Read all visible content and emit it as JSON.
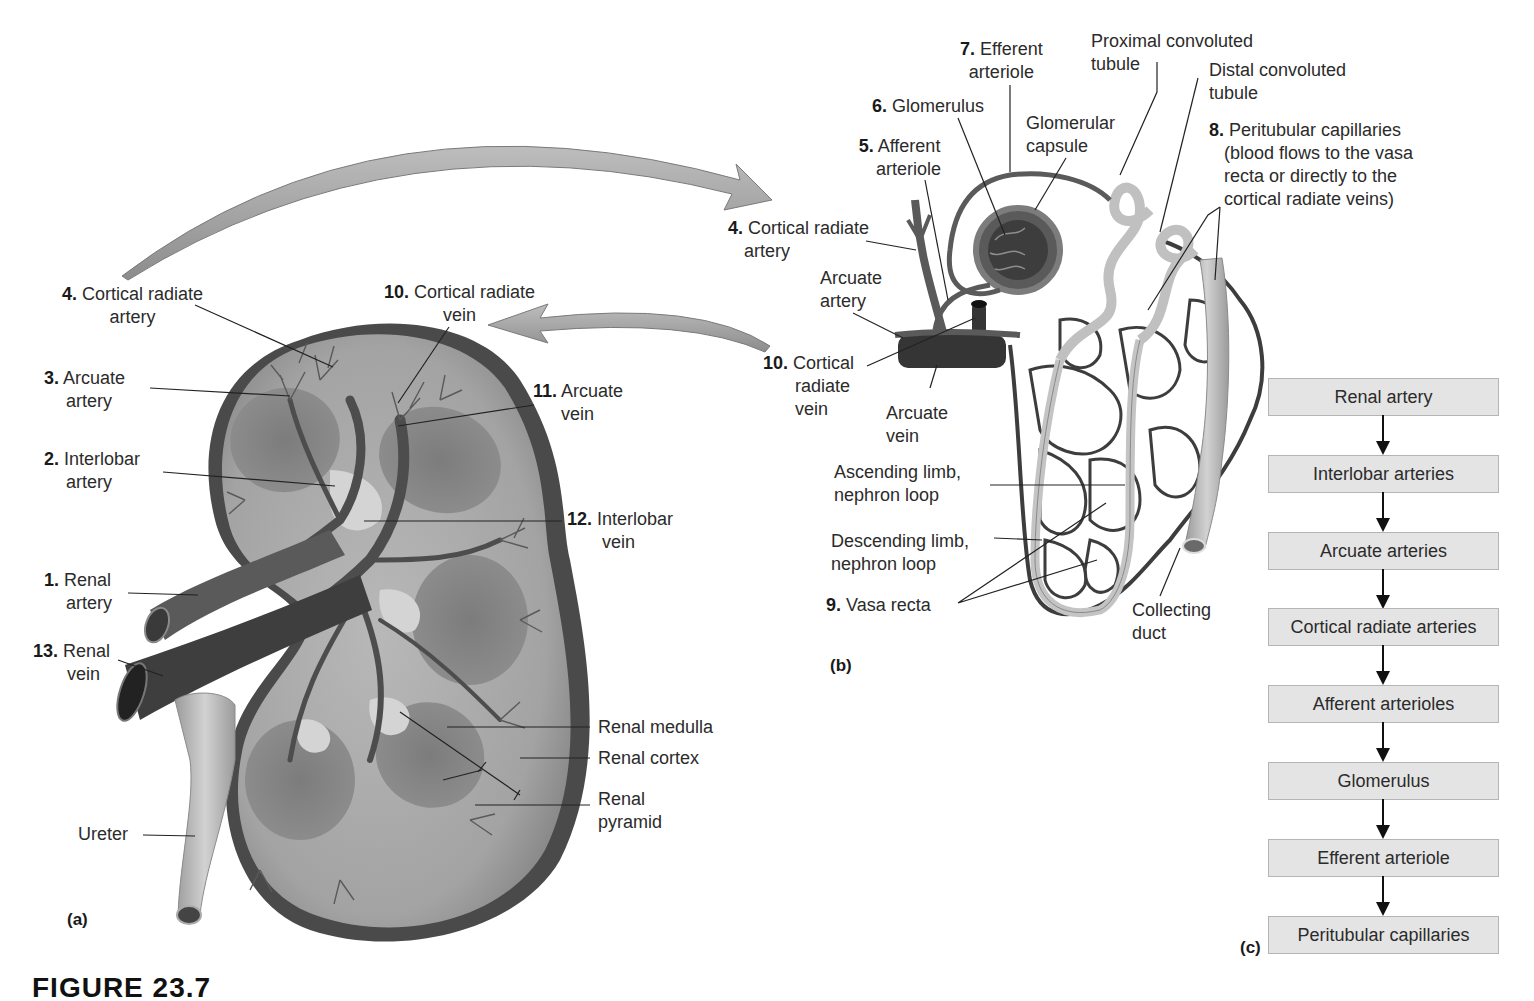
{
  "panel_a": {
    "letter": "(a)",
    "labels": [
      {
        "id": "cortical-radiate-artery",
        "num": "4.",
        "text": "Cortical radiate",
        "text2": "artery"
      },
      {
        "id": "arcuate-artery",
        "num": "3.",
        "text": "Arcuate",
        "text2": "artery"
      },
      {
        "id": "interlobar-artery",
        "num": "2.",
        "text": "Interlobar",
        "text2": "artery"
      },
      {
        "id": "renal-artery",
        "num": "1.",
        "text": "Renal",
        "text2": "artery"
      },
      {
        "id": "renal-vein",
        "num": "13.",
        "text": "Renal",
        "text2": "vein"
      },
      {
        "id": "ureter",
        "num": "",
        "text": "Ureter",
        "text2": ""
      },
      {
        "id": "cortical-radiate-vein",
        "num": "10.",
        "text": "Cortical radiate",
        "text2": "vein"
      },
      {
        "id": "arcuate-vein",
        "num": "11.",
        "text": "Arcuate",
        "text2": "vein"
      },
      {
        "id": "interlobar-vein",
        "num": "12.",
        "text": "Interlobar",
        "text2": "vein"
      },
      {
        "id": "renal-medulla",
        "num": "",
        "text": "Renal medulla",
        "text2": ""
      },
      {
        "id": "renal-cortex",
        "num": "",
        "text": "Renal cortex",
        "text2": ""
      },
      {
        "id": "renal-pyramid",
        "num": "",
        "text": "Renal",
        "text2": "pyramid"
      }
    ]
  },
  "panel_b": {
    "letter": "(b)",
    "labels": [
      {
        "id": "efferent-arteriole",
        "num": "7.",
        "text": "Efferent",
        "text2": "arteriole"
      },
      {
        "id": "proximal-convoluted-tubule",
        "num": "",
        "text": "Proximal convoluted",
        "text2": "tubule"
      },
      {
        "id": "distal-convoluted-tubule",
        "num": "",
        "text": "Distal convoluted",
        "text2": "tubule"
      },
      {
        "id": "glomerulus",
        "num": "6.",
        "text": "Glomerulus",
        "text2": ""
      },
      {
        "id": "glomerular-capsule",
        "num": "",
        "text": "Glomerular",
        "text2": "capsule"
      },
      {
        "id": "afferent-arteriole",
        "num": "5.",
        "text": "Afferent",
        "text2": "arteriole"
      },
      {
        "id": "peritubular-capillaries",
        "num": "8.",
        "text": "Peritubular capillaries",
        "text2": "(blood flows to the vasa",
        "text3": "recta or directly to the",
        "text4": "cortical radiate veins)"
      },
      {
        "id": "cortical-radiate-artery-b",
        "num": "4.",
        "text": "Cortical radiate",
        "text2": "artery"
      },
      {
        "id": "arcuate-artery-b",
        "num": "",
        "text": "Arcuate",
        "text2": "artery"
      },
      {
        "id": "cortical-radiate-vein-b",
        "num": "10.",
        "text": "Cortical",
        "text2": "radiate",
        "text3": "vein"
      },
      {
        "id": "arcuate-vein-b",
        "num": "",
        "text": "Arcuate",
        "text2": "vein"
      },
      {
        "id": "ascending-limb",
        "num": "",
        "text": "Ascending limb,",
        "text2": "nephron loop"
      },
      {
        "id": "descending-limb",
        "num": "",
        "text": "Descending limb,",
        "text2": "nephron loop"
      },
      {
        "id": "vasa-recta",
        "num": "9.",
        "text": "Vasa recta",
        "text2": ""
      },
      {
        "id": "collecting-duct",
        "num": "",
        "text": "Collecting",
        "text2": "duct"
      }
    ]
  },
  "panel_c": {
    "letter": "(c)",
    "flow": [
      "Renal artery",
      "Interlobar arteries",
      "Arcuate arteries",
      "Cortical radiate arteries",
      "Afferent arterioles",
      "Glomerulus",
      "Efferent arteriole",
      "Peritubular capillaries"
    ]
  },
  "caption": "FIGURE 23.7",
  "colors": {
    "vessel_dark": "#3f3f3f",
    "vessel_mid": "#6a6a6a",
    "tissue": "#a9a9a9",
    "cortex": "#bdbdbd",
    "capsule": "#4a4a4a",
    "tubule": "#c8c8c8",
    "flow_box": "#e4e4e4",
    "big_arrow": "#a8a8a8"
  }
}
